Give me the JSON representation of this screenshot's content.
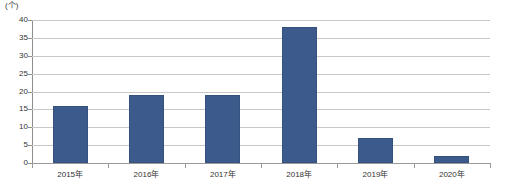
{
  "chart_data": {
    "type": "bar",
    "title": "",
    "subtitle": "",
    "xlabel": "",
    "ylabel": "",
    "unit_label": "(个)",
    "categories": [
      "2015年",
      "2016年",
      "2017年",
      "2018年",
      "2019年",
      "2020年"
    ],
    "values": [
      16,
      19,
      19,
      38,
      7,
      2
    ],
    "series": [
      {
        "name": "",
        "values": [
          16,
          19,
          19,
          38,
          7,
          2
        ]
      }
    ],
    "ylim": [
      0,
      40
    ],
    "ytick_labels": [
      "0",
      "5",
      "10",
      "15",
      "20",
      "25",
      "30",
      "35",
      "40"
    ],
    "ytick_values": [
      0,
      5,
      10,
      15,
      20,
      25,
      30,
      35,
      40
    ],
    "grid": true,
    "grid_axis": "y",
    "legend": false,
    "legend_position": "none",
    "bar_color": "#3c5b8c",
    "grid_color": "#c8c8c8",
    "axis_color": "#8e8e8e",
    "background_color": "#ffffff"
  }
}
